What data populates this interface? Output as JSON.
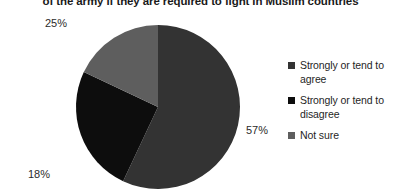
{
  "chart_data": {
    "type": "pie",
    "title": "of the army if they are required to fight in Muslim countries",
    "categories": [
      "Strongly or tend to agree",
      "Strongly or tend to disagree",
      "Not sure"
    ],
    "values": [
      57,
      25,
      18
    ],
    "value_labels": [
      "57%",
      "25%",
      "18%"
    ],
    "colors": [
      "#333333",
      "#0d0d0d",
      "#5e5e5e"
    ],
    "legend_position": "right",
    "grid": false,
    "xlabel": "",
    "ylabel": ""
  },
  "legend": {
    "items": [
      {
        "label": "Strongly or tend to agree",
        "color": "#333333"
      },
      {
        "label": "Strongly or tend to disagree",
        "color": "#0d0d0d"
      },
      {
        "label": "Not sure",
        "color": "#5e5e5e"
      }
    ]
  }
}
